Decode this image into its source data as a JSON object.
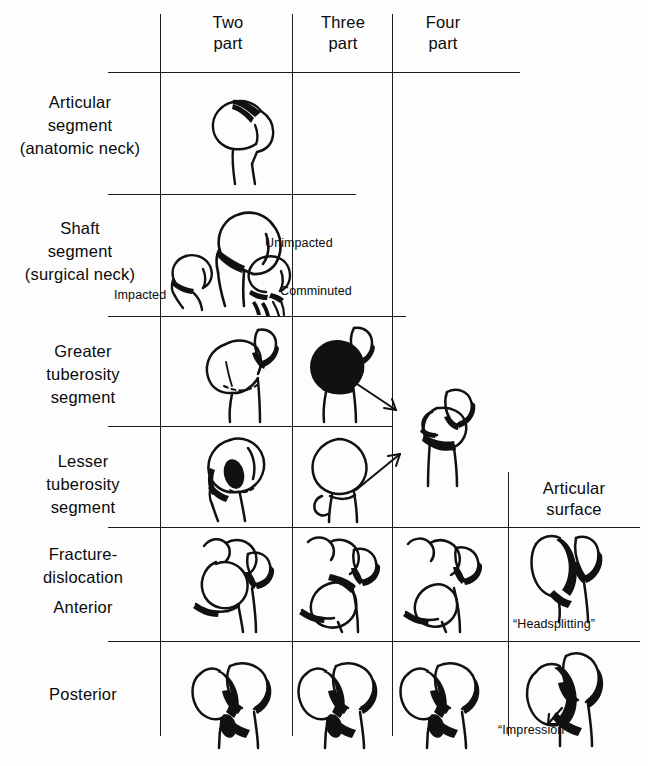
{
  "figure": {
    "line_color": "#1c1c1c",
    "fill_color": "#0a0a0a",
    "paper_color": "#fdfdfd"
  },
  "columns": [
    {
      "id": "two-part",
      "label": "Two\npart"
    },
    {
      "id": "three-part",
      "label": "Three\npart"
    },
    {
      "id": "four-part",
      "label": "Four\npart"
    },
    {
      "id": "articular-surface",
      "label": "Articular\nsurface"
    }
  ],
  "rows": [
    {
      "id": "articular-segment",
      "label": "Articular\nsegment\n(anatomic neck)"
    },
    {
      "id": "shaft-segment",
      "label": "Shaft\nsegment\n(surgical neck)"
    },
    {
      "id": "greater-tuberosity",
      "label": "Greater\ntuberosity\nsegment"
    },
    {
      "id": "lesser-tuberosity",
      "label": "Lesser\ntuberosity\nsegment"
    },
    {
      "id": "fracture-dislocation-anterior",
      "label": "Fracture-\ndislocation"
    },
    {
      "id": "anterior",
      "label": "Anterior"
    },
    {
      "id": "posterior",
      "label": "Posterior"
    }
  ],
  "annotations": {
    "impacted": "Impacted",
    "unimpacted": "Unimpacted",
    "comminuted": "Comminuted",
    "headsplitting": "“Headsplitting”",
    "impression": "“Impression”"
  }
}
